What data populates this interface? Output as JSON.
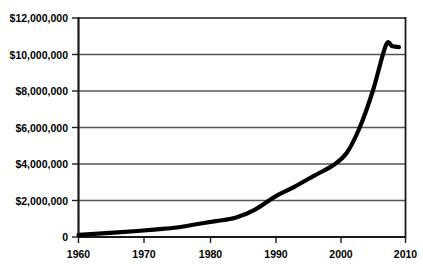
{
  "chart_data": {
    "type": "line",
    "title": "",
    "xlabel": "",
    "ylabel": "",
    "grid": true,
    "legend": "none",
    "xlim": [
      1960,
      2010
    ],
    "ylim": [
      0,
      12000000
    ],
    "x_ticks": [
      1960,
      1970,
      1980,
      1990,
      2000,
      2010
    ],
    "x_tick_labels": [
      "1960",
      "1970",
      "1980",
      "1990",
      "2000",
      "2010"
    ],
    "y_ticks": [
      0,
      2000000,
      4000000,
      6000000,
      8000000,
      10000000,
      12000000
    ],
    "y_tick_labels": [
      "0",
      "$2,000,000",
      "$4,000,000",
      "$6,000,000",
      "$8,000,000",
      "$10,000,000",
      "$12,000,000"
    ],
    "series": [
      {
        "name": "series-1",
        "color": "#000000",
        "x": [
          1960,
          1963,
          1966,
          1969,
          1972,
          1975,
          1978,
          1981,
          1984,
          1987,
          1990,
          1993,
          1996,
          1999,
          2001,
          2003,
          2005,
          2007,
          2008,
          2009
        ],
        "values": [
          120000,
          180000,
          250000,
          330000,
          420000,
          520000,
          700000,
          870000,
          1050000,
          1500000,
          2200000,
          2750000,
          3350000,
          3950000,
          4600000,
          6000000,
          8000000,
          10500000,
          10450000,
          10400000
        ]
      }
    ]
  },
  "axis": {
    "y_tick_labels": [
      "$12,000,000",
      "$10,000,000",
      "$8,000,000",
      "$6,000,000",
      "$4,000,000",
      "$2,000,000",
      "0"
    ],
    "x_tick_labels": [
      "1960",
      "1970",
      "1980",
      "1990",
      "2000",
      "2010"
    ]
  },
  "colors": {
    "line": "#000000",
    "grid": "#555555",
    "axis": "#1a1a1a",
    "background": "#ffffff"
  }
}
